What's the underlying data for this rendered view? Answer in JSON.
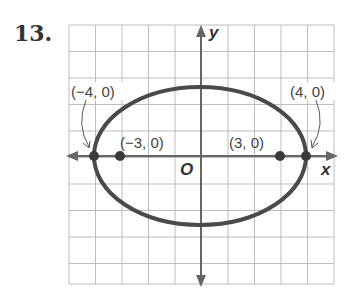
{
  "problem_number": "13.",
  "graph": {
    "x_axis_label": "x",
    "y_axis_label": "y",
    "origin_label": "O",
    "grid": {
      "cols": 10,
      "rows": 10,
      "unit_px": 26.5
    },
    "ellipse": {
      "center": [
        0,
        0
      ],
      "a": 4,
      "b": 2.6
    },
    "points": [
      {
        "label": "(−4, 0)",
        "x": -4,
        "y": 0,
        "role": "vertex"
      },
      {
        "label": "(−3, 0)",
        "x": -3,
        "y": 0,
        "role": "focus"
      },
      {
        "label": "(3, 0)",
        "x": 3,
        "y": 0,
        "role": "focus"
      },
      {
        "label": "(4, 0)",
        "x": 4,
        "y": 0,
        "role": "vertex"
      }
    ]
  },
  "colors": {
    "curve": "#4a4a4a",
    "grid": "#b8b8b8",
    "axis": "#666666",
    "point": "#3a3a3a"
  }
}
